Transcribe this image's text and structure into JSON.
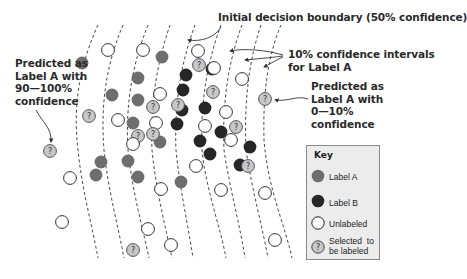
{
  "annotations": {
    "decision_boundary": "Initial decision boundary (50% confidence)",
    "confidence_intervals": "10% confidence intervals\nfor Label A",
    "high_confidence": "Predicted as\nLabel A with\n90—100%\nconfidence",
    "low_confidence": "Predicted as\nLabel A with\n0—10%\nconfidence"
  },
  "key": {
    "title": "Key",
    "items": [
      {
        "type": "label-a",
        "label": "Label A"
      },
      {
        "type": "label-b",
        "label": "Label B"
      },
      {
        "type": "unlabeled",
        "label": "Unlabeled"
      },
      {
        "type": "selected",
        "label": "Selected  to\nbe labeled"
      }
    ]
  },
  "colors": {
    "label_a": "#6e6e6e",
    "label_b": "#262626",
    "unlabeled_fill": "#ffffff",
    "selected_fill": "#c8c8c8",
    "stroke": "#333333"
  },
  "points": [
    {
      "x": 82,
      "y": 63,
      "t": "A"
    },
    {
      "x": 108,
      "y": 50,
      "t": "U"
    },
    {
      "x": 143,
      "y": 50,
      "t": "U"
    },
    {
      "x": 162,
      "y": 57,
      "t": "A"
    },
    {
      "x": 138,
      "y": 78,
      "t": "A"
    },
    {
      "x": 112,
      "y": 95,
      "t": "A"
    },
    {
      "x": 138,
      "y": 100,
      "t": "A"
    },
    {
      "x": 160,
      "y": 94,
      "t": "U"
    },
    {
      "x": 153,
      "y": 107,
      "t": "S"
    },
    {
      "x": 89,
      "y": 116,
      "t": "S"
    },
    {
      "x": 118,
      "y": 120,
      "t": "U"
    },
    {
      "x": 133,
      "y": 123,
      "t": "A"
    },
    {
      "x": 138,
      "y": 136,
      "t": "S"
    },
    {
      "x": 156,
      "y": 123,
      "t": "U"
    },
    {
      "x": 160,
      "y": 142,
      "t": "A"
    },
    {
      "x": 133,
      "y": 144,
      "t": "U"
    },
    {
      "x": 153,
      "y": 134,
      "t": "S"
    },
    {
      "x": 198,
      "y": 51,
      "t": "U"
    },
    {
      "x": 186,
      "y": 75,
      "t": "B"
    },
    {
      "x": 212,
      "y": 69,
      "t": "B"
    },
    {
      "x": 214,
      "y": 68,
      "t": "U"
    },
    {
      "x": 213,
      "y": 92,
      "t": "S"
    },
    {
      "x": 183,
      "y": 90,
      "t": "B"
    },
    {
      "x": 205,
      "y": 108,
      "t": "B"
    },
    {
      "x": 182,
      "y": 110,
      "t": "B"
    },
    {
      "x": 178,
      "y": 105,
      "t": "S"
    },
    {
      "x": 177,
      "y": 124,
      "t": "B"
    },
    {
      "x": 205,
      "y": 126,
      "t": "U"
    },
    {
      "x": 200,
      "y": 141,
      "t": "B"
    },
    {
      "x": 221,
      "y": 132,
      "t": "B"
    },
    {
      "x": 226,
      "y": 112,
      "t": "U"
    },
    {
      "x": 231,
      "y": 140,
      "t": "U"
    },
    {
      "x": 236,
      "y": 127,
      "t": "S"
    },
    {
      "x": 199,
      "y": 65,
      "t": "S"
    },
    {
      "x": 210,
      "y": 154,
      "t": "B"
    },
    {
      "x": 196,
      "y": 166,
      "t": "U"
    },
    {
      "x": 240,
      "y": 165,
      "t": "B"
    },
    {
      "x": 248,
      "y": 166,
      "t": "S"
    },
    {
      "x": 221,
      "y": 190,
      "t": "U"
    },
    {
      "x": 242,
      "y": 79,
      "t": "U"
    },
    {
      "x": 265,
      "y": 99,
      "t": "S"
    },
    {
      "x": 250,
      "y": 147,
      "t": "B"
    },
    {
      "x": 265,
      "y": 193,
      "t": "U"
    },
    {
      "x": 275,
      "y": 240,
      "t": "U"
    },
    {
      "x": 50,
      "y": 151,
      "t": "S"
    },
    {
      "x": 70,
      "y": 178,
      "t": "U"
    },
    {
      "x": 96,
      "y": 175,
      "t": "A"
    },
    {
      "x": 138,
      "y": 177,
      "t": "A"
    },
    {
      "x": 62,
      "y": 222,
      "t": "U"
    },
    {
      "x": 101,
      "y": 162,
      "t": "A"
    },
    {
      "x": 128,
      "y": 161,
      "t": "A"
    },
    {
      "x": 161,
      "y": 189,
      "t": "U"
    },
    {
      "x": 148,
      "y": 229,
      "t": "U"
    },
    {
      "x": 133,
      "y": 250,
      "t": "S"
    },
    {
      "x": 171,
      "y": 245,
      "t": "U"
    },
    {
      "x": 181,
      "y": 182,
      "t": "A"
    }
  ]
}
